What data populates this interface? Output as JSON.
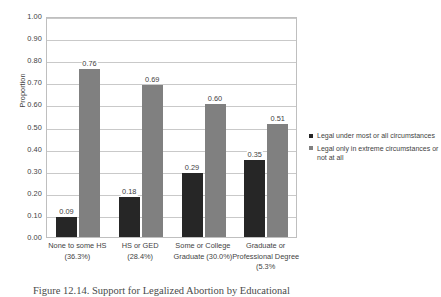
{
  "chart_data": {
    "type": "bar",
    "title": "",
    "xlabel": "",
    "ylabel": "Proportion",
    "ylim": [
      0,
      1.0
    ],
    "ytick_step": 0.1,
    "grid": true,
    "legend_position": "right",
    "categories": [
      "None to some HS",
      "HS or GED",
      "Some or College Graduate",
      "Graduate or Professional Degree"
    ],
    "category_lines": [
      [
        "None to some HS",
        "(36.3%)"
      ],
      [
        "HS or GED",
        "(28.4%)"
      ],
      [
        "Some or College",
        "Graduate (30.0%)"
      ],
      [
        "Graduate or",
        "Professional Degree",
        "(5.3%"
      ]
    ],
    "category_percents": [
      "36.3%",
      "28.4%",
      "30.0%",
      "5.3%"
    ],
    "yticks": [
      "0.00",
      "0.10",
      "0.20",
      "0.30",
      "0.40",
      "0.50",
      "0.60",
      "0.70",
      "0.80",
      "0.90",
      "1.00"
    ],
    "series": [
      {
        "name": "Legal under most or all circumstances",
        "color": "#262626",
        "values": [
          0.09,
          0.18,
          0.29,
          0.35
        ],
        "labels": [
          "0.09",
          "0.18",
          "0.29",
          "0.35"
        ]
      },
      {
        "name": "Legal only in extreme circumstances or not at all",
        "color": "#808080",
        "values": [
          0.76,
          0.69,
          0.6,
          0.51
        ],
        "labels": [
          "0.76",
          "0.69",
          "0.60",
          "0.51"
        ]
      }
    ]
  },
  "legend": {
    "entries": [
      {
        "label": "Legal under most or all circumstances",
        "color": "#262626"
      },
      {
        "label": "Legal only in extreme circumstances or not at all",
        "color": "#808080"
      }
    ]
  },
  "caption": {
    "text": "Figure 12.14. Support for Legalized Abortion by Educational"
  }
}
